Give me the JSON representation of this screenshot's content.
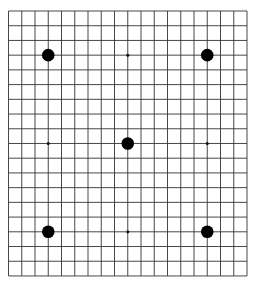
{
  "caption": {
    "text": "",
    "note": "top caption cropped; unreadable"
  },
  "board": {
    "size": 19,
    "origin_x": 8.5,
    "origin_y": 11,
    "spacing_x": 13.25,
    "spacing_y": 14.72,
    "line_color": "#333333",
    "background": "#ffffff",
    "star_points": [
      {
        "col": 9,
        "row": 3
      },
      {
        "col": 3,
        "row": 9
      },
      {
        "col": 15,
        "row": 9
      },
      {
        "col": 9,
        "row": 15
      }
    ],
    "stones": [
      {
        "col": 3,
        "row": 3,
        "color": "black"
      },
      {
        "col": 15,
        "row": 3,
        "color": "black"
      },
      {
        "col": 9,
        "row": 9,
        "color": "black"
      },
      {
        "col": 3,
        "row": 15,
        "color": "black"
      },
      {
        "col": 15,
        "row": 15,
        "color": "black"
      }
    ],
    "stone_radius": 6.3,
    "star_radius": 1.5
  }
}
